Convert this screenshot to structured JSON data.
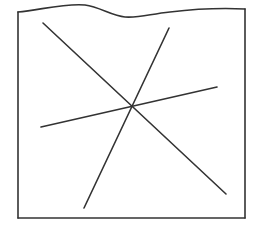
{
  "diagram": {
    "stroke_color": "#333333",
    "background": "#ffffff",
    "frame": {
      "wavy_top_path": "M18,12 C40,10 65,3 85,5 C100,7 112,16 125,17 C140,18 150,14 170,12 C195,9 225,8 245,9",
      "left": 18,
      "right": 245,
      "bottom": 218
    },
    "lines": [
      {
        "id": "line-1",
        "x1": 43,
        "y1": 23,
        "x2": 226,
        "y2": 194
      },
      {
        "id": "line-2",
        "x1": 169,
        "y1": 28,
        "x2": 84,
        "y2": 208
      },
      {
        "id": "line-3",
        "x1": 41,
        "y1": 127,
        "x2": 217,
        "y2": 87
      }
    ],
    "intersection": {
      "x": 132,
      "y": 106
    }
  }
}
